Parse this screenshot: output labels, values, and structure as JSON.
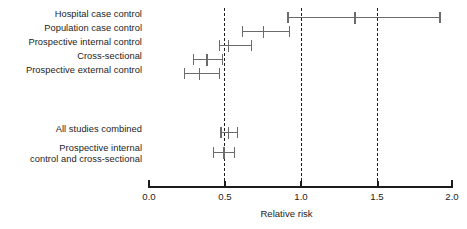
{
  "chart_data": {
    "type": "forest",
    "title": "",
    "xlabel": "Relative risk",
    "ylabel": "",
    "xlim": [
      0.0,
      2.0
    ],
    "xticks": [
      "0.0",
      "0.5",
      "1.0",
      "1.5",
      "2.0"
    ],
    "xtick_values": [
      0.0,
      0.5,
      1.0,
      1.5,
      2.0
    ],
    "grid": false,
    "legend": "none",
    "reference_lines": [
      0.5,
      1.0,
      1.5
    ],
    "reference_line_style": "dashed",
    "categories": [
      "Hospital case control",
      "Population case control",
      "Prospective internal control",
      "Cross-sectional",
      "Prospective external control",
      "All studies combined",
      "Prospective internal\ncontrol and cross-sectional"
    ],
    "rows": [
      {
        "label": "Hospital case control",
        "estimate": 1.36,
        "ci_low": 0.92,
        "ci_high": 1.92,
        "group": "individual"
      },
      {
        "label": "Population case control",
        "estimate": 0.76,
        "ci_low": 0.62,
        "ci_high": 0.93,
        "group": "individual"
      },
      {
        "label": "Prospective internal control",
        "estimate": 0.53,
        "ci_low": 0.47,
        "ci_high": 0.68,
        "group": "individual"
      },
      {
        "label": "Cross-sectional",
        "estimate": 0.39,
        "ci_low": 0.3,
        "ci_high": 0.49,
        "group": "individual"
      },
      {
        "label": "Prospective external control",
        "estimate": 0.34,
        "ci_low": 0.24,
        "ci_high": 0.47,
        "group": "individual"
      },
      {
        "label": "All studies combined",
        "estimate": 0.53,
        "ci_low": 0.48,
        "ci_high": 0.59,
        "group": "summary"
      },
      {
        "label": "Prospective internal\ncontrol and cross-sectional",
        "estimate": 0.5,
        "ci_low": 0.43,
        "ci_high": 0.57,
        "group": "summary"
      }
    ],
    "colors": {
      "interval": "#6b6b6b",
      "axis": "#1c1c1c",
      "reference": "#1c1c1c",
      "text": "#1c1c1c",
      "background": "#ffffff"
    }
  }
}
